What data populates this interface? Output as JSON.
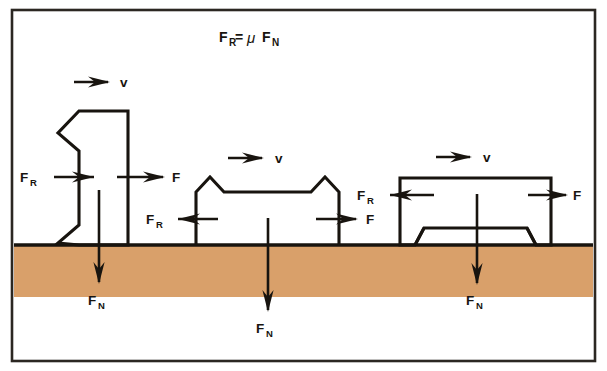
{
  "figure": {
    "title": {
      "formula_lhs": "F",
      "formula_lhs_sub": "R",
      "equals": "=",
      "mu": "μ",
      "formula_rhs": "F",
      "formula_rhs_sub": "N",
      "full_text": "FR = μ FN"
    },
    "caption_note": "Friction force equals coefficient of friction times normal force",
    "colors": {
      "ground_fill": "#d9a06a",
      "ink": "#18140f",
      "frame": "#2b2722",
      "background": "#ffffff"
    },
    "ground": {
      "label": "ground-surface",
      "line_y": 245,
      "band_bottom_y": 297
    },
    "labels": {
      "velocity": "v",
      "friction_force": "F",
      "friction_force_sub": "R",
      "applied_force": "F",
      "normal_force": "F",
      "normal_force_sub": "N"
    },
    "bodies": [
      {
        "id": "body-left",
        "name": "tall-zigzag-block",
        "description": "Tall narrow block with sawtooth left face resting on ground",
        "velocity_label": "v",
        "friction_label": "FR",
        "applied_label": "F",
        "normal_label": "FN"
      },
      {
        "id": "body-middle",
        "name": "gabled-peak-block",
        "description": "Wide block with two pointed peaks and recessed flat top",
        "velocity_label": "v",
        "friction_label": "FR",
        "applied_label": "F",
        "normal_label": "FN"
      },
      {
        "id": "body-right",
        "name": "v-legged-block",
        "description": "Rectangular block standing on two V-shaped pointed legs",
        "velocity_label": "v",
        "friction_label": "FR",
        "applied_label": "F",
        "normal_label": "FN"
      }
    ]
  }
}
